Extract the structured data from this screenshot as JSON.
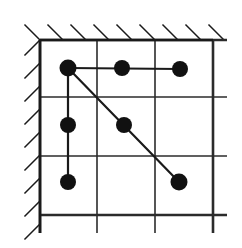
{
  "figure": {
    "kind": "mechanism-node-link-diagram",
    "width": 242,
    "height": 248,
    "background_color": "#ffffff",
    "ink_color": "#1a1a1a",
    "grid_color": "#2b2b2b",
    "node_color": "#111111",
    "frame": {
      "name": "grid-frame",
      "left": 40,
      "top": 40,
      "right": 213,
      "bottom": 215,
      "border_width": 2.6
    },
    "grid": {
      "vertical_x": [
        40,
        97,
        155,
        213
      ],
      "horizontal_y": [
        40,
        97,
        156,
        215
      ],
      "line_width": 1.6,
      "overshoot_bottom": 18,
      "overshoot_right": 14
    },
    "hatching": {
      "name": "fixed-support-hatching",
      "line_width": 1.5,
      "length": 22,
      "angle_deg": 45,
      "top": {
        "y": 40,
        "x_start": 40,
        "x_end": 226,
        "count": 9,
        "spacing": 23
      },
      "left": {
        "x": 40,
        "y_start": 40,
        "y_end": 230,
        "count": 9,
        "spacing": 23
      }
    },
    "nodes": [
      {
        "id": "n1",
        "label": "A",
        "x": 68,
        "y": 68,
        "r": 8.5
      },
      {
        "id": "n2",
        "label": "B",
        "x": 122,
        "y": 68,
        "r": 8.0
      },
      {
        "id": "n3",
        "label": "C",
        "x": 180,
        "y": 69,
        "r": 8.0
      },
      {
        "id": "n4",
        "label": "D",
        "x": 68,
        "y": 125,
        "r": 8.0
      },
      {
        "id": "n5",
        "label": "E",
        "x": 124,
        "y": 125,
        "r": 8.0
      },
      {
        "id": "n6",
        "label": "F",
        "x": 68,
        "y": 182,
        "r": 8.0
      },
      {
        "id": "n7",
        "label": "G",
        "x": 179,
        "y": 182,
        "r": 8.5
      }
    ],
    "members": [
      {
        "id": "m1",
        "name": "horizontal-member",
        "from": "n1",
        "to": "n3",
        "x1": 68,
        "y1": 68,
        "x2": 180,
        "y2": 69,
        "width": 2.2
      },
      {
        "id": "m2",
        "name": "vertical-member",
        "from": "n1",
        "to": "n6",
        "x1": 68,
        "y1": 68,
        "x2": 68,
        "y2": 182,
        "width": 2.2
      },
      {
        "id": "m3",
        "name": "diagonal-member",
        "from": "n1",
        "to": "n7",
        "x1": 68,
        "y1": 68,
        "x2": 179,
        "y2": 182,
        "width": 2.2
      }
    ]
  }
}
